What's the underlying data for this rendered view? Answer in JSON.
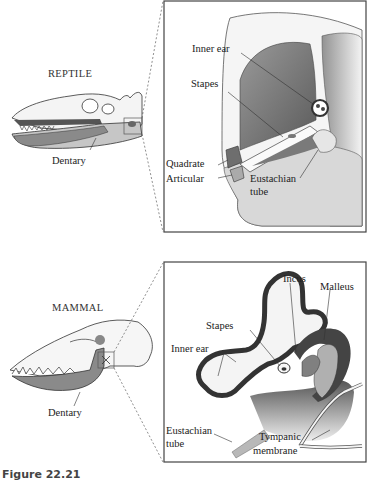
{
  "figure": {
    "caption": "Figure 22.21",
    "panels": [
      {
        "id": "reptile",
        "title": "REPTILE",
        "skull_label": "Dentary",
        "detail_labels": [
          "Inner ear",
          "Stapes",
          "Quadrate",
          "Articular",
          "Eustachian tube"
        ]
      },
      {
        "id": "mammal",
        "title": "MAMMAL",
        "skull_label": "Dentary",
        "detail_labels": [
          "Incus",
          "Malleus",
          "Stapes",
          "Inner ear",
          "Eustachian tube",
          "Tympanic membrane"
        ]
      }
    ]
  },
  "labels": {
    "reptile_title": "REPTILE",
    "reptile_dentary": "Dentary",
    "reptile_inner_ear": "Inner ear",
    "reptile_stapes": "Stapes",
    "reptile_quadrate": "Quadrate",
    "reptile_articular": "Articular",
    "reptile_eustachian_1": "Eustachian",
    "reptile_eustachian_2": "tube",
    "mammal_title": "MAMMAL",
    "mammal_dentary": "Dentary",
    "mammal_incus": "Incus",
    "mammal_malleus": "Malleus",
    "mammal_stapes": "Stapes",
    "mammal_inner_ear": "Inner ear",
    "mammal_eustachian_1": "Eustachian",
    "mammal_eustachian_2": "tube",
    "mammal_tympanic_1": "Tympanic",
    "mammal_tympanic_2": "membrane",
    "caption": "Figure 22.21"
  },
  "colors": {
    "bone_light": "#f2f2f2",
    "bone_mid": "#c8c8c8",
    "bone_dark": "#7a7a7a",
    "outline": "#333333",
    "panel_border": "#444444"
  }
}
